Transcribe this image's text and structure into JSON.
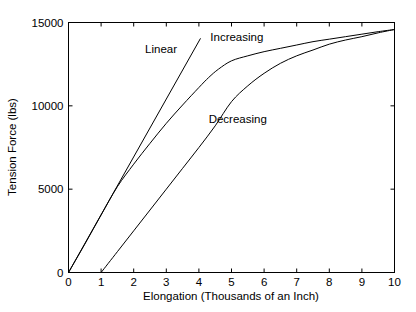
{
  "chart_data": {
    "type": "line",
    "title": "",
    "xlabel": "Elongation (Thousands of an Inch)",
    "ylabel": "Tension Force (lbs)",
    "xlim": [
      0,
      10
    ],
    "ylim": [
      0,
      15000
    ],
    "xticks": [
      0,
      1,
      2,
      3,
      4,
      5,
      6,
      7,
      8,
      9,
      10
    ],
    "xtick_labels": [
      "0",
      "1",
      "2",
      "3",
      "4",
      "5",
      "6",
      "7",
      "8",
      "9",
      "10"
    ],
    "yticks": [
      0,
      5000,
      10000,
      15000
    ],
    "ytick_labels": [
      "0",
      "5000",
      "10000",
      "15000"
    ],
    "grid": false,
    "legend": "inline-annotations",
    "line_color": "#000000",
    "background_color": "#ffffff",
    "series": [
      {
        "name": "Linear",
        "annotation": "Linear",
        "x": [
          0,
          4.05
        ],
        "values": [
          0,
          14050
        ]
      },
      {
        "name": "Increasing",
        "annotation": "Increasing",
        "x": [
          0,
          0.5,
          1.0,
          1.5,
          2.0,
          2.5,
          3.0,
          3.5,
          4.0,
          4.3,
          4.6,
          5.0,
          5.5,
          6.0,
          6.5,
          7.0,
          7.5,
          8.0,
          8.5,
          9.0,
          9.5,
          10.0
        ],
        "values": [
          0,
          1700,
          3450,
          5150,
          6500,
          7750,
          8950,
          10050,
          11100,
          11700,
          12200,
          12700,
          13000,
          13250,
          13450,
          13650,
          13850,
          14000,
          14150,
          14300,
          14450,
          14580
        ]
      },
      {
        "name": "Decreasing",
        "annotation": "Decreasing",
        "x": [
          1.0,
          1.5,
          2.0,
          2.5,
          3.0,
          3.5,
          4.0,
          4.5,
          5.0,
          5.5,
          6.0,
          6.5,
          7.0,
          7.5,
          8.0,
          8.5,
          9.0,
          9.5,
          10.0
        ],
        "values": [
          0,
          1250,
          2500,
          3750,
          5000,
          6250,
          7500,
          8800,
          10250,
          11200,
          11950,
          12550,
          13000,
          13350,
          13700,
          13950,
          14150,
          14380,
          14580
        ]
      }
    ],
    "annotations": [
      {
        "text": "Linear",
        "x": 2.35,
        "y": 13150
      },
      {
        "text": "Increasing",
        "x": 4.35,
        "y": 13900
      },
      {
        "text": "Decreasing",
        "x": 4.3,
        "y": 9000
      }
    ]
  }
}
